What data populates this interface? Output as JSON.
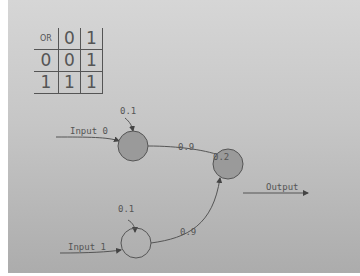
{
  "truth_table": {
    "corner_label": "OR",
    "column_headers": [
      "0",
      "1"
    ],
    "rows": [
      {
        "header": "0",
        "cells": [
          "0",
          "1"
        ]
      },
      {
        "header": "1",
        "cells": [
          "1",
          "1"
        ]
      }
    ]
  },
  "network": {
    "inputs": [
      {
        "label": "Input 0",
        "bias": "0.1",
        "weight": "0.9"
      },
      {
        "label": "Input 1",
        "bias": "0.1",
        "weight": "0.9"
      }
    ],
    "output": {
      "label": "Output",
      "bias": "0.2"
    }
  },
  "colors": {
    "background_top": "#d6d6d6",
    "background_bottom": "#acacac",
    "stroke": "#555555",
    "active_node_fill": "#9a9a9a"
  }
}
